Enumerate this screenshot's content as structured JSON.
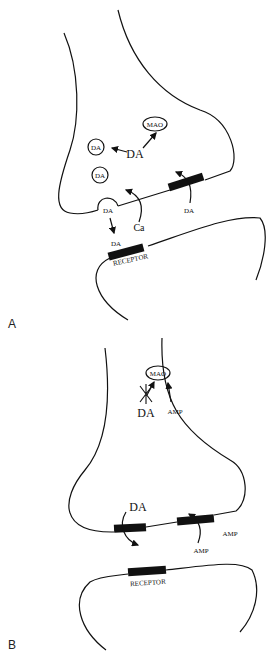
{
  "panel_a": {
    "label": "A",
    "da_center": "DA",
    "mao": "MAO",
    "vesicle_1": "DA",
    "vesicle_2": "DA",
    "vesicle_release": "DA",
    "released_da": "DA",
    "ca": "Ca",
    "reuptake_da": "DA",
    "receptor": "RECEPTOR"
  },
  "panel_b": {
    "label": "B",
    "da_blocked": "DA",
    "mao": "MAO",
    "amp_inside": "AMP",
    "da_membrane": "DA",
    "amp_right": "AMP",
    "amp_uptake": "AMP",
    "receptor": "RECEPTOR"
  }
}
